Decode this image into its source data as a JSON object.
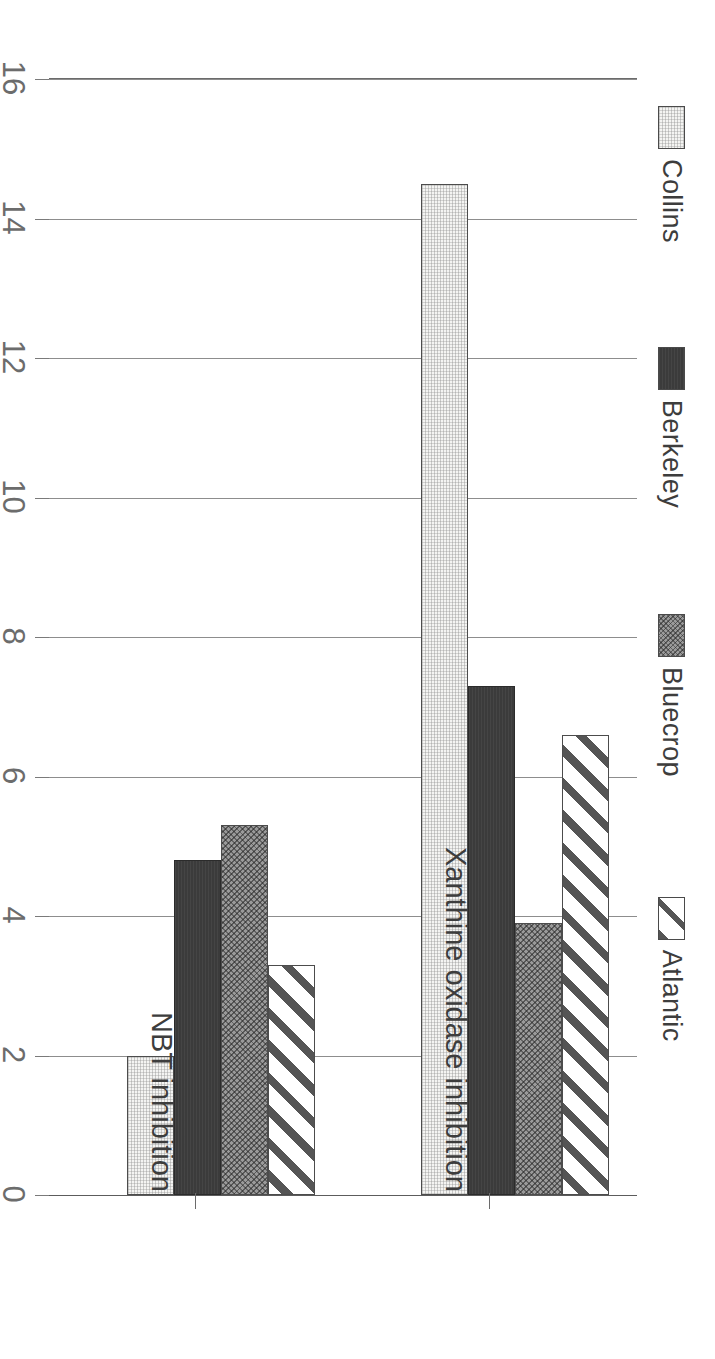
{
  "chart_data": {
    "type": "bar",
    "orientation": "horizontal-rotated-90cw",
    "title": "",
    "subtitle": "",
    "xlabel": "",
    "ylabel": "uL/mL or % inhibition",
    "ylim": [
      0,
      16
    ],
    "yticks": [
      0,
      2,
      4,
      6,
      8,
      10,
      12,
      14,
      16
    ],
    "ytick_labels": [
      "0",
      "2",
      "4",
      "6",
      "8",
      "10",
      "12",
      "14",
      "16"
    ],
    "grid": true,
    "legend_position": "top",
    "categories": [
      "NBT inhibition",
      "Xanthine oxidase inhibition"
    ],
    "series": [
      {
        "name": "Collins",
        "pattern": "light-stipple",
        "color": "#f4f4f2",
        "values": [
          2.0,
          14.5
        ]
      },
      {
        "name": "Berkeley",
        "pattern": "solid-dark",
        "color": "#3b3b3b",
        "values": [
          4.8,
          7.3
        ]
      },
      {
        "name": "Bluecrop",
        "pattern": "mid-gray-dotted",
        "color": "#9a9a9a",
        "values": [
          5.3,
          3.9
        ]
      },
      {
        "name": "Atlantic",
        "pattern": "diagonal-hatch",
        "color": "#ffffff",
        "values": [
          3.3,
          6.6
        ]
      }
    ]
  },
  "legend": {
    "items": [
      {
        "label": "Collins"
      },
      {
        "label": "Berkeley"
      },
      {
        "label": "Bluecrop"
      },
      {
        "label": "Atlantic"
      }
    ]
  },
  "axis": {
    "value_title": "uL/mL or % inhibition",
    "ticks": [
      "16",
      "14",
      "12",
      "10",
      "8",
      "6",
      "4",
      "2",
      "0"
    ]
  },
  "categories": {
    "labels": [
      "Xanthine oxidase inhibition",
      "NBT inhibition"
    ]
  }
}
